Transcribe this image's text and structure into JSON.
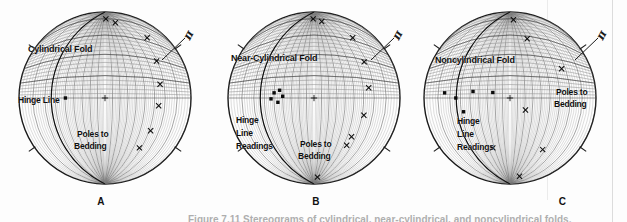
{
  "figure": {
    "caption": "Figure 7.11   Stereograms of cylindrical, near-cylindrical, and noncylindrical folds.",
    "background_color": "#fdfdfd",
    "ink_color": "#1a1a1a"
  },
  "panels": [
    {
      "letter": "A",
      "title": "Cylindrical Fold",
      "pi_symbol": "π",
      "labels": {
        "hinge": "Hinge Line",
        "poles_line1": "Poles to",
        "poles_line2": "Bedding"
      },
      "hinge_points": [
        {
          "x": 0.5,
          "y": 0.5,
          "kind": "center-cross"
        },
        {
          "x": 0.27,
          "y": 0.5,
          "kind": "square"
        }
      ],
      "pole_points": [
        {
          "x": 0.745,
          "y": 0.15
        },
        {
          "x": 0.8,
          "y": 0.285
        },
        {
          "x": 0.82,
          "y": 0.42
        },
        {
          "x": 0.812,
          "y": 0.545
        },
        {
          "x": 0.765,
          "y": 0.69
        },
        {
          "x": 0.7,
          "y": 0.79
        },
        {
          "x": 0.56,
          "y": 0.062
        },
        {
          "x": 0.505,
          "y": 0.04
        }
      ],
      "girdle_label_pos": {
        "x": 0.97,
        "y": 0.2
      }
    },
    {
      "letter": "B",
      "title": "Near-Cylindrical Fold",
      "pi_symbol": "π",
      "labels": {
        "hinge_line1": "Hinge",
        "hinge_line2": "Line",
        "hinge_line3": "Readings",
        "poles_line1": "Poles to",
        "poles_line2": "Bedding"
      },
      "hinge_points": [
        {
          "x": 0.5,
          "y": 0.5,
          "kind": "center-cross"
        },
        {
          "x": 0.3,
          "y": 0.455,
          "kind": "square"
        },
        {
          "x": 0.268,
          "y": 0.47,
          "kind": "square"
        },
        {
          "x": 0.25,
          "y": 0.505,
          "kind": "square"
        },
        {
          "x": 0.29,
          "y": 0.525,
          "kind": "square"
        },
        {
          "x": 0.318,
          "y": 0.49,
          "kind": "square"
        }
      ],
      "pole_points": [
        {
          "x": 0.725,
          "y": 0.15
        },
        {
          "x": 0.792,
          "y": 0.29
        },
        {
          "x": 0.818,
          "y": 0.44
        },
        {
          "x": 0.79,
          "y": 0.6
        },
        {
          "x": 0.718,
          "y": 0.725
        },
        {
          "x": 0.69,
          "y": 0.775
        },
        {
          "x": 0.545,
          "y": 0.055
        },
        {
          "x": 0.495,
          "y": 0.04
        },
        {
          "x": 0.52,
          "y": 0.96
        }
      ],
      "girdle_label_pos": {
        "x": 0.97,
        "y": 0.2
      }
    },
    {
      "letter": "C",
      "title": "Noncylindrical Fold",
      "pi_symbol": "π",
      "labels": {
        "hinge_line1": "Hinge",
        "hinge_line2": "Line",
        "hinge_line3": "Readings",
        "poles_line1": "Poles to",
        "poles_line2": "Bedding"
      },
      "hinge_points": [
        {
          "x": 0.5,
          "y": 0.5,
          "kind": "center-cross"
        },
        {
          "x": 0.12,
          "y": 0.47,
          "kind": "square"
        },
        {
          "x": 0.185,
          "y": 0.5,
          "kind": "square"
        },
        {
          "x": 0.285,
          "y": 0.462,
          "kind": "square"
        },
        {
          "x": 0.4,
          "y": 0.468,
          "kind": "square"
        },
        {
          "x": 0.23,
          "y": 0.58,
          "kind": "square"
        }
      ],
      "pole_points": [
        {
          "x": 0.6,
          "y": 0.155
        },
        {
          "x": 0.8,
          "y": 0.33
        },
        {
          "x": 0.59,
          "y": 0.57
        },
        {
          "x": 0.4,
          "y": 0.79
        },
        {
          "x": 0.69,
          "y": 0.8
        },
        {
          "x": 0.555,
          "y": 0.955
        },
        {
          "x": 0.52,
          "y": 0.045
        }
      ],
      "girdle_label_pos": {
        "x": 0.97,
        "y": 0.2
      }
    }
  ],
  "chart_data": {
    "type": "scatter",
    "projection": "equal-area stereonet (lower hemisphere), 2° grid",
    "axis_note": "Full-circle primitive with great-circle and small-circle grid",
    "legend": [
      "Poles to Bedding (×)",
      "Hinge Line Readings (■)",
      "π-circle (great circle girdle)"
    ],
    "panels": [
      {
        "label": "A",
        "name": "Cylindrical Fold",
        "poles_count": 8,
        "hinge_count": 1,
        "pole_distribution": "tight great-circle girdle",
        "hinge_distribution": "single point (π-axis)"
      },
      {
        "label": "B",
        "name": "Near-Cylindrical Fold",
        "poles_count": 9,
        "hinge_count": 5,
        "pole_distribution": "broad girdle about a π-circle",
        "hinge_distribution": "tight cluster"
      },
      {
        "label": "C",
        "name": "Noncylindrical Fold",
        "poles_count": 7,
        "hinge_count": 5,
        "pole_distribution": "scattered, no girdle",
        "hinge_distribution": "widely dispersed"
      }
    ]
  }
}
